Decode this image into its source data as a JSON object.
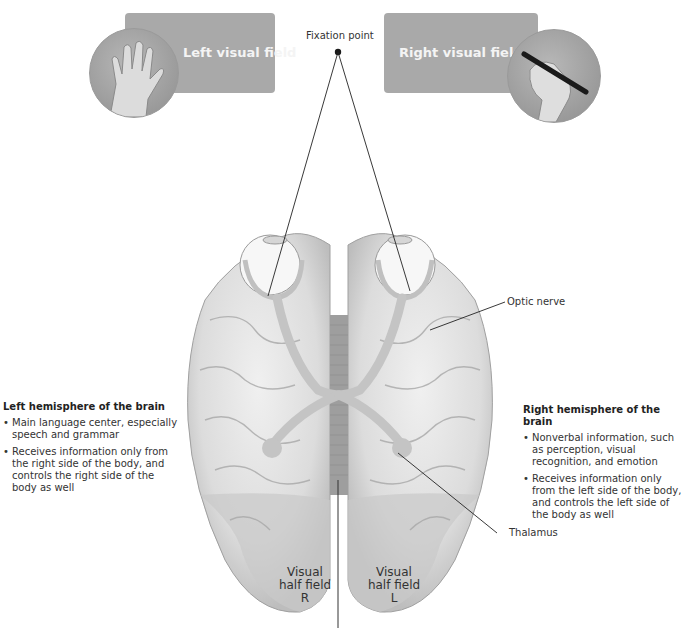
{
  "top": {
    "left_field_label": "Left visual field",
    "right_field_label": "Right visual field",
    "fixation_label": "Fixation point"
  },
  "labels": {
    "optic_nerve": "Optic nerve",
    "thalamus": "Thalamus"
  },
  "left_hemisphere": {
    "title": "Left hemisphere of the brain",
    "bullets": [
      "Main language center, especially speech and grammar",
      "Receives information only from the right side of the body, and controls the right side of the body as well"
    ]
  },
  "right_hemisphere": {
    "title": "Right hemisphere of the brain",
    "bullets": [
      "Nonverbal information, such as perception, visual recognition, and emotion",
      "Receives information only from the left side of the body, and controls the left side of the body as well"
    ]
  },
  "visual_half_fields": {
    "left_lobe": {
      "line1": "Visual",
      "line2": "half field",
      "line3": "R"
    },
    "right_lobe": {
      "line1": "Visual",
      "line2": "half field",
      "line3": "L"
    }
  },
  "colors": {
    "field_box": "#a9a9a9",
    "brain_light": "#e6e6e6",
    "brain_shadow": "#b5b5b5",
    "nerve": "#c4c4c4"
  }
}
